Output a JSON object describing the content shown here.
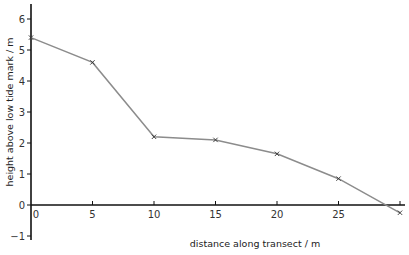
{
  "chart_data": {
    "type": "line",
    "title": "",
    "xlabel": "distance along transect / m",
    "ylabel": "height above low tide mark / m",
    "x": [
      0,
      5,
      10,
      15,
      20,
      25,
      30
    ],
    "series": [
      {
        "name": "profile",
        "values": [
          5.4,
          4.6,
          2.2,
          2.1,
          1.65,
          0.85,
          -0.25
        ]
      }
    ],
    "xticks": [
      "0",
      "5",
      "10",
      "15",
      "20",
      "25"
    ],
    "yticks": [
      "-1",
      "0",
      "1",
      "2",
      "3",
      "4",
      "5",
      "6"
    ],
    "xlim": [
      0,
      30
    ],
    "ylim": [
      -1,
      6.5
    ],
    "grid": false,
    "legend": "none",
    "marker": "x",
    "line_color": "#8c8c8c",
    "axis_color": "#111111"
  }
}
